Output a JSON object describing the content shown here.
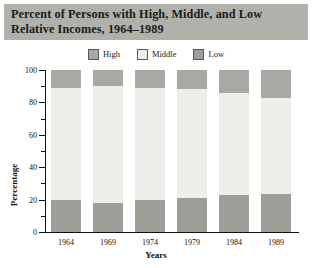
{
  "title": {
    "line1": "Percent of Persons with High, Middle, and Low",
    "line2": "Relative Incomes, 1964–1989"
  },
  "colors": {
    "banner": "#b1b1ac",
    "high": "#a9a9a4",
    "middle": "#ededea",
    "low": "#9e9e99",
    "axis": "#111111"
  },
  "legend": [
    {
      "label": "High",
      "color": "#a9a9a4"
    },
    {
      "label": "Middle",
      "color": "#ededea"
    },
    {
      "label": "Low",
      "color": "#9e9e99"
    }
  ],
  "chart_data": {
    "type": "bar",
    "subtype": "stacked-bar",
    "title": "Percent of Persons with High, Middle, and Low Relative Incomes, 1964–1989",
    "xlabel": "Years",
    "ylabel": "Percentage",
    "categories": [
      "1964",
      "1969",
      "1974",
      "1979",
      "1984",
      "1989"
    ],
    "series": [
      {
        "name": "Low",
        "color": "#9e9e99",
        "values": [
          20,
          18,
          20,
          21,
          23,
          23.5
        ]
      },
      {
        "name": "Middle",
        "color": "#ededea",
        "values": [
          69,
          72,
          69,
          67,
          63,
          59.5
        ]
      },
      {
        "name": "High",
        "color": "#a9a9a4",
        "values": [
          11,
          10,
          11,
          12,
          14,
          17
        ]
      }
    ],
    "stack_order": [
      "Low",
      "Middle",
      "High"
    ],
    "ylim": [
      0,
      100
    ],
    "yticks": [
      0,
      20,
      40,
      60,
      80,
      100
    ],
    "yticks_minor": [
      10,
      30,
      50,
      70,
      90
    ],
    "ytick_labels": [
      "0",
      "20",
      "40",
      "60",
      "80",
      "100"
    ],
    "grid": false,
    "legend_position": "top-center"
  }
}
